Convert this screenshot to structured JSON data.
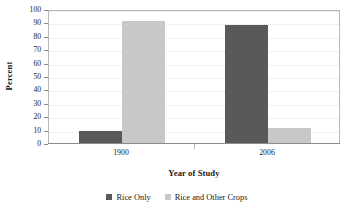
{
  "chart_data": {
    "type": "bar",
    "title": "",
    "subtitle": "",
    "xlabel": "Year of Study",
    "ylabel": "Percent",
    "categories": [
      "1900",
      "2006"
    ],
    "series": [
      {
        "name": "Rice Only",
        "values": [
          9,
          88
        ],
        "color": "#595959"
      },
      {
        "name": "Rice and Other Crops",
        "values": [
          91,
          11
        ],
        "color": "#c8c8c8"
      }
    ],
    "ylim": [
      0,
      100
    ],
    "ytick_labels": [
      "0",
      "10",
      "20",
      "30",
      "40",
      "50",
      "60",
      "70",
      "80",
      "90",
      "100"
    ],
    "ytick_values": [
      0,
      10,
      20,
      30,
      40,
      50,
      60,
      70,
      80,
      90,
      100
    ],
    "ytick_step": 10,
    "grid": true,
    "grid_axis": "y",
    "grid_style": "dotted",
    "legend_position": "bottom",
    "plot_border": true,
    "orientation": "vertical",
    "bar_gap": 0
  },
  "axes": {
    "y_title": "Percent",
    "x_title": "Year of Study"
  },
  "legend": {
    "items": [
      {
        "label": "Rice Only",
        "swatch": "series-0"
      },
      {
        "label": "Rice and Other Crops",
        "swatch": "series-1"
      }
    ]
  },
  "colors": {
    "series_dark": "#595959",
    "series_light": "#c8c8c8",
    "gridline": "#e2e2e2",
    "plot_border": "#b9b9b9",
    "axis_line": "#8c8c8c",
    "background": "#ffffff",
    "text": "#1a1a1a"
  }
}
